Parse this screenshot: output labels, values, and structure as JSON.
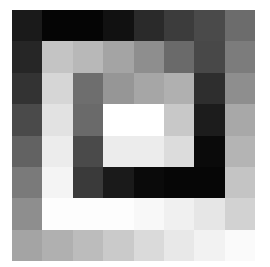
{
  "image": {
    "rows": 8,
    "cols": 8,
    "background": "#ffffff",
    "cells": [
      [
        "#1a1a1a",
        "#050505",
        "#050505",
        "#111111",
        "#2a2a2a",
        "#3c3c3c",
        "#4a4a4a",
        "#6c6c6c"
      ],
      [
        "#262626",
        "#c4c4c4",
        "#b8b8b8",
        "#a4a4a4",
        "#8e8e8e",
        "#6a6a6a",
        "#484848",
        "#7c7c7c"
      ],
      [
        "#333333",
        "#d6d6d6",
        "#6e6e6e",
        "#969696",
        "#a6a6a6",
        "#b0b0b0",
        "#2e2e2e",
        "#8e8e8e"
      ],
      [
        "#4a4a4a",
        "#e2e2e2",
        "#6a6a6a",
        "#ffffff",
        "#ffffff",
        "#c8c8c8",
        "#1c1c1c",
        "#a8a8a8"
      ],
      [
        "#626262",
        "#ececec",
        "#4a4a4a",
        "#ececec",
        "#ececec",
        "#dcdcdc",
        "#0a0a0a",
        "#b4b4b4"
      ],
      [
        "#7a7a7a",
        "#f4f4f4",
        "#3a3a3a",
        "#1a1a1a",
        "#0a0a0a",
        "#060606",
        "#060606",
        "#c4c4c4"
      ],
      [
        "#8e8e8e",
        "#fdfdfd",
        "#fdfdfd",
        "#fdfdfd",
        "#f8f8f8",
        "#f0f0f0",
        "#e6e6e6",
        "#d2d2d2"
      ],
      [
        "#a4a4a4",
        "#b0b0b0",
        "#bcbcbc",
        "#cacaca",
        "#dadada",
        "#e8e8e8",
        "#f2f2f2",
        "#fafafa"
      ]
    ]
  }
}
